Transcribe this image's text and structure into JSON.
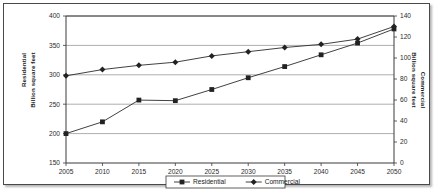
{
  "chart_data": {
    "type": "line",
    "title": "",
    "xlabel": "",
    "categories": [
      "2005",
      "2010",
      "2015",
      "2020",
      "2025",
      "2030",
      "2035",
      "2040",
      "2045",
      "2050"
    ],
    "grid": true,
    "legend_position": "bottom",
    "axes": {
      "left": {
        "label_line1": "Residential",
        "label_line2": "Billion square feet",
        "ylim": [
          150,
          400
        ],
        "ticks": [
          150,
          200,
          250,
          300,
          350,
          400
        ]
      },
      "right": {
        "label_line1": "Commercial",
        "label_line2": "Billion square feet",
        "ylim": [
          0,
          140
        ],
        "ticks": [
          0,
          20,
          40,
          60,
          80,
          100,
          120,
          140
        ]
      }
    },
    "series": [
      {
        "name": "Residential",
        "axis": "left",
        "marker": "square",
        "color": "#222222",
        "values": [
          200,
          220,
          257,
          256,
          275,
          295,
          314,
          334,
          354,
          378
        ]
      },
      {
        "name": "Commercial",
        "axis": "right",
        "marker": "diamond",
        "color": "#222222",
        "values": [
          83,
          89,
          93,
          96,
          102,
          106,
          110,
          113,
          118,
          130
        ]
      }
    ],
    "legend": [
      {
        "label": "Residential",
        "marker": "square"
      },
      {
        "label": "Commercial",
        "marker": "diamond"
      }
    ]
  }
}
